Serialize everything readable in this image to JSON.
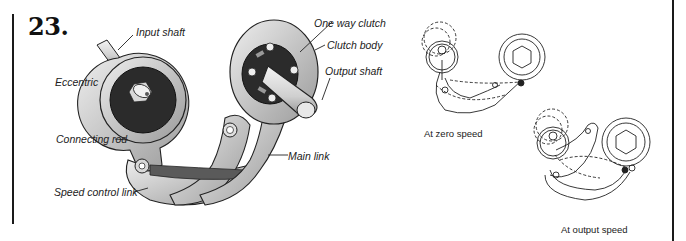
{
  "figure": {
    "number": "23.",
    "main_illustration": {
      "labels": {
        "input_shaft": "Input shaft",
        "eccentric": "Eccentric",
        "connecting_rod": "Connecting rod",
        "speed_control_link": "Speed control link",
        "one_way_clutch": "One way clutch",
        "clutch_body": "Clutch body",
        "output_shaft": "Output shaft",
        "main_link": "Main link"
      }
    },
    "schematics": [
      {
        "caption": "At zero speed"
      },
      {
        "caption": "At output speed"
      }
    ]
  },
  "colors": {
    "ink": "#1a1a1a",
    "metal": "#c9c9c9",
    "metal_dark": "#8a8a8a",
    "eccentric_face": "#2b2b2b"
  }
}
